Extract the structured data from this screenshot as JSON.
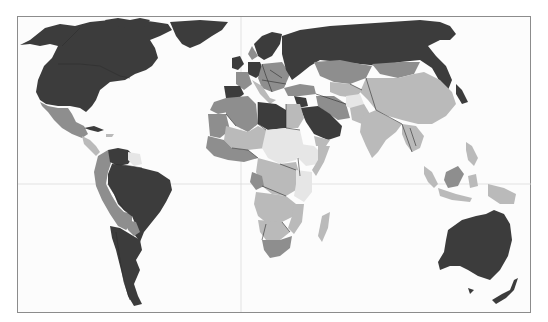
{
  "map": {
    "type": "choropleth-world-map",
    "projection": "equirectangular-like",
    "palette": {
      "ocean": "#fcfcfc",
      "frame": "#8c8c8c",
      "grid": "#dcdcdc",
      "class_1_dark": "#3c3c3c",
      "class_2_medium": "#8e8e8e",
      "class_3_light": "#bababa",
      "class_4_pale": "#e6e6e6"
    },
    "gridlines": [
      "equator",
      "prime-meridian"
    ],
    "regions": {
      "dark": [
        "Canada",
        "United States",
        "Greenland",
        "Russia",
        "Brazil",
        "Venezuela",
        "Argentina",
        "Chile",
        "Uruguay",
        "Australia",
        "New Zealand",
        "Libya",
        "Saudi Arabia",
        "Spain",
        "Germany",
        "United Kingdom",
        "Norway",
        "Sweden",
        "Finland",
        "Ukraine",
        "Oman",
        "UAE",
        "Kuwait"
      ],
      "medium": [
        "Mexico",
        "Peru",
        "Bolivia",
        "Paraguay",
        "Colombia",
        "Algeria",
        "Morocco",
        "Mauritania",
        "South Africa",
        "Kazakhstan",
        "Mongolia",
        "Iran",
        "Turkey",
        "France",
        "Italy",
        "Malaysia",
        "Papua New Guinea",
        "Congo"
      ],
      "light": [
        "China",
        "India",
        "Pakistan",
        "Egypt",
        "Indonesia",
        "Madagascar",
        "Angola",
        "DR Congo",
        "Zambia",
        "Namibia",
        "Botswana",
        "Mozambique",
        "Mali",
        "Niger",
        "Thailand",
        "Myanmar",
        "Somalia",
        "Ecuador"
      ],
      "pale": [
        "Chad",
        "Sudan",
        "Ethiopia",
        "Kenya",
        "Tanzania",
        "Afghanistan",
        "Central African Republic",
        "Guyana",
        "Suriname",
        "Vietnam",
        "Laos",
        "Greenland-interior-ice"
      ]
    }
  }
}
